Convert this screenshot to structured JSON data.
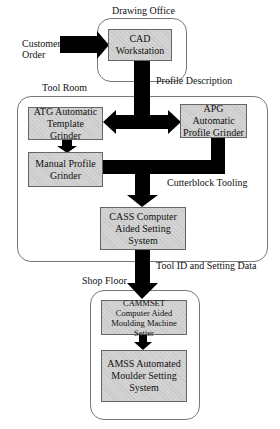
{
  "regions": {
    "drawing_office": "Drawing Office",
    "tool_room": "Tool Room",
    "shop_floor": "Shop Floor"
  },
  "nodes": {
    "cad": {
      "line1": "CAD",
      "line2": "Workstation"
    },
    "atg": {
      "line1": "ATG Automatic",
      "line2": "Template Grinder"
    },
    "apg": {
      "line1": "APG Automatic",
      "line2": "Profile Grinder"
    },
    "manual": {
      "line1": "Manual Profile",
      "line2": "Grinder"
    },
    "cass": {
      "line1": "CASS Computer",
      "line2": "Aided Setting System"
    },
    "cammset": {
      "line1": "CAMMSET",
      "line2": "Computer Aided",
      "line3": "Moulding Machine Setter"
    },
    "amss": {
      "line1": "AMSS Automated",
      "line2": "Moulder Setting",
      "line3": "System"
    }
  },
  "edges": {
    "customer_order": {
      "line1": "Customer",
      "line2": "Order"
    },
    "profile_description": "Profile Description",
    "cutterblock_tooling": "Cutterblock Tooling",
    "tool_id_setting_data": "Tool ID and Setting Data"
  },
  "colors": {
    "node_fill": "#d4d4d4",
    "arrow": "#000000",
    "region_border": "#777777"
  }
}
